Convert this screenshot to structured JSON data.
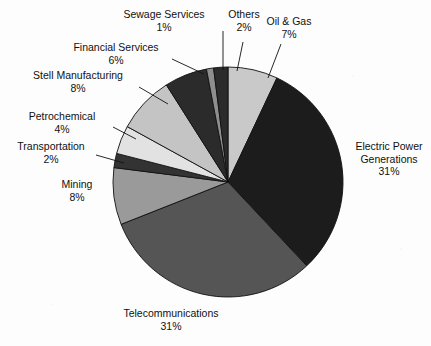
{
  "chart_data": {
    "type": "pie",
    "title": "",
    "subtitle": "",
    "xlabel": "",
    "ylabel": "",
    "legend_position": "none",
    "labels_position": "outside-with-leader-lines",
    "grid": false,
    "units": "percent",
    "total": 100,
    "start_angle_deg": 0,
    "direction": "clockwise",
    "categories": [
      "Oil & Gas",
      "Electric Power Generations",
      "Telecommunications",
      "Mining",
      "Transportation",
      "Petrochemical",
      "Stell Manufacturing",
      "Financial Services",
      "Sewage Services",
      "Others"
    ],
    "values": [
      7,
      31,
      31,
      8,
      2,
      4,
      8,
      6,
      1,
      2
    ],
    "colors": [
      "#c9c9c9",
      "#1c1c1c",
      "#555555",
      "#9a9a9a",
      "#333333",
      "#e2e2e2",
      "#c4c4c4",
      "#2b2b2b",
      "#8e8e8e",
      "#2b2b2b"
    ],
    "slices": [
      {
        "name": "Oil & Gas",
        "value": 7,
        "value_label": "7%",
        "color": "#c9c9c9"
      },
      {
        "name": "Electric Power Generations",
        "value": 31,
        "value_label": "31%",
        "color": "#1c1c1c"
      },
      {
        "name": "Telecommunications",
        "value": 31,
        "value_label": "31%",
        "color": "#555555"
      },
      {
        "name": "Mining",
        "value": 8,
        "value_label": "8%",
        "color": "#9a9a9a"
      },
      {
        "name": "Transportation",
        "value": 2,
        "value_label": "2%",
        "color": "#333333"
      },
      {
        "name": "Petrochemical",
        "value": 4,
        "value_label": "4%",
        "color": "#e2e2e2"
      },
      {
        "name": "Stell Manufacturing",
        "value": 8,
        "value_label": "8%",
        "color": "#c4c4c4"
      },
      {
        "name": "Financial Services",
        "value": 6,
        "value_label": "6%",
        "color": "#2b2b2b"
      },
      {
        "name": "Sewage Services",
        "value": 1,
        "value_label": "1%",
        "color": "#8e8e8e"
      },
      {
        "name": "Others",
        "value": 2,
        "value_label": "2%",
        "color": "#2b2b2b"
      }
    ]
  },
  "labels": {
    "sewage_services": {
      "name": "Sewage Services",
      "pct": "1%"
    },
    "others": {
      "name": "Others",
      "pct": "2%"
    },
    "oil_gas": {
      "name": "Oil & Gas",
      "pct": "7%"
    },
    "financial": {
      "name": "Financial Services",
      "pct": "6%"
    },
    "steel": {
      "name": "Stell Manufacturing",
      "pct": "8%"
    },
    "petrochemical": {
      "name": "Petrochemical",
      "pct": "4%"
    },
    "transportation": {
      "name": "Transportation",
      "pct": "2%"
    },
    "mining": {
      "name": "Mining",
      "pct": "8%"
    },
    "telecom": {
      "name": "Telecommunications",
      "pct": "31%"
    },
    "electric": {
      "name1": "Electric Power",
      "name2": "Generations",
      "pct": "31%"
    }
  },
  "style": {
    "outline_color": "#111111",
    "background": "#fdfdfd"
  }
}
